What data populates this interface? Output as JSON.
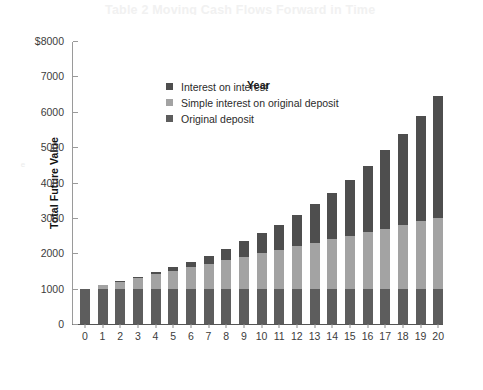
{
  "page": {
    "header_ghost": "Table 2 Moving Cash Flows Forward in Time",
    "side_ghost": "e"
  },
  "chart_data": {
    "type": "bar",
    "stacked": true,
    "title": "",
    "xlabel": "Year",
    "ylabel": "Total Future Value",
    "ylim": [
      0,
      8000
    ],
    "yticks": [
      {
        "value": 8000,
        "label": "$8000"
      },
      {
        "value": 7000,
        "label": "7000"
      },
      {
        "value": 6000,
        "label": "6000"
      },
      {
        "value": 5000,
        "label": "5000"
      },
      {
        "value": 4000,
        "label": "4000"
      },
      {
        "value": 3000,
        "label": "3000"
      },
      {
        "value": 2000,
        "label": "2000"
      },
      {
        "value": 1000,
        "label": "1000"
      },
      {
        "value": 0,
        "label": "0"
      }
    ],
    "grid": false,
    "legend_position": "upper-left-inside",
    "categories": [
      "0",
      "1",
      "2",
      "3",
      "4",
      "5",
      "6",
      "7",
      "8",
      "9",
      "10",
      "11",
      "12",
      "13",
      "14",
      "15",
      "16",
      "17",
      "18",
      "19",
      "20"
    ],
    "series": [
      {
        "name": "Original deposit",
        "color": "#5d5d5d",
        "values": [
          1000,
          1000,
          1000,
          1000,
          1000,
          1000,
          1000,
          1000,
          1000,
          1000,
          1000,
          1000,
          1000,
          1000,
          1000,
          1000,
          1000,
          1000,
          1000,
          1000,
          1000
        ]
      },
      {
        "name": "Simple interest on original deposit",
        "color": "#a3a3a3",
        "values": [
          0,
          100,
          200,
          300,
          400,
          500,
          600,
          700,
          800,
          900,
          1000,
          1100,
          1200,
          1300,
          1400,
          1500,
          1600,
          1700,
          1800,
          1900,
          2000
        ]
      },
      {
        "name": "Interest on interest",
        "color": "#4e4e4e",
        "values": [
          0,
          0,
          10,
          31,
          64,
          105,
          161,
          236,
          323,
          437,
          559,
          713,
          884,
          1092,
          1316,
          1583,
          1870,
          2206,
          2569,
          2991,
          3440
        ]
      }
    ],
    "totals": [
      1000,
      1100,
      1210,
      1331,
      1464,
      1605,
      1761,
      1936,
      2123,
      2337,
      2559,
      2813,
      3084,
      3392,
      3716,
      4083,
      4470,
      4906,
      5369,
      5891,
      6440
    ],
    "legend": [
      {
        "label": "Interest on interest",
        "color": "#4e4e4e"
      },
      {
        "label": "Simple interest on original deposit",
        "color": "#a3a3a3"
      },
      {
        "label": "Original deposit",
        "color": "#5d5d5d"
      }
    ]
  }
}
